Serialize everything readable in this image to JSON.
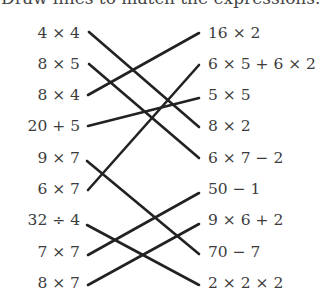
{
  "title": "Draw lines to match the expressions.",
  "left_expressions": [
    "4 × 4",
    "8 × 5",
    "8 × 4",
    "20 + 5",
    "9 × 7",
    "6 × 7",
    "32 ÷ 4",
    "7 × 7",
    "8 × 7"
  ],
  "right_expressions": [
    "16 × 2",
    "6 × 5 + 6 × 2",
    "5 × 5",
    "8 × 2",
    "6 × 7 − 2",
    "50 − 1",
    "9 × 6 + 2",
    "70 − 7",
    "2 × 2 × 2"
  ],
  "matches": [
    {
      "left": "4 × 4",
      "right": "8 × 2"
    },
    {
      "left": "8 × 5",
      "right": "6 × 7 − 2"
    },
    {
      "left": "8 × 4",
      "right": "16 × 2"
    },
    {
      "left": "20 + 5",
      "right": "5 × 5"
    },
    {
      "left": "9 × 7",
      "right": "70 − 7"
    },
    {
      "left": "6 × 7",
      "right": "6 × 5 + 6 × 2"
    },
    {
      "left": "32 ÷ 4",
      "right": "2 × 2 × 2"
    },
    {
      "left": "7 × 7",
      "right": "50 − 1"
    },
    {
      "left": "8 × 7",
      "right": "9 × 6 + 2"
    }
  ]
}
